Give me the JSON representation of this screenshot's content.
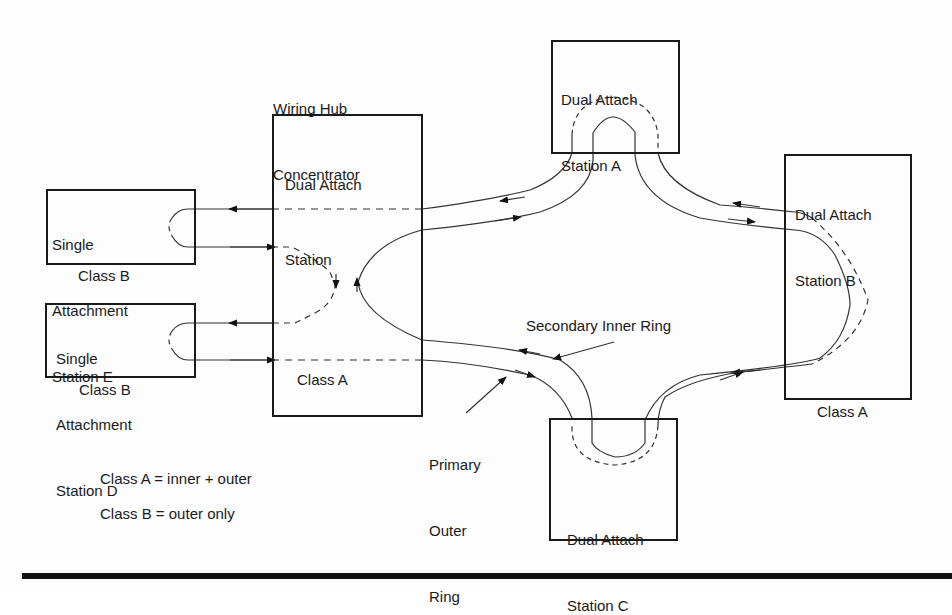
{
  "diagram": {
    "title_label": {
      "line1": "Wiring Hub",
      "line2": "Concentrator"
    },
    "nodes": {
      "concentrator": {
        "line1": "Dual Attach",
        "line2": "Station",
        "class_label": "Class A"
      },
      "station_e": {
        "line1": "Single",
        "line2": "Attachment",
        "line3": "Station E",
        "class_label": "Class B"
      },
      "station_d": {
        "line1": "Single",
        "line2": "Attachment",
        "line3": "Station D",
        "class_label": "Class B"
      },
      "station_a": {
        "line1": "Dual Attach",
        "line2": "Station A"
      },
      "station_b": {
        "line1": "Dual Attach",
        "line2": "Station B",
        "class_label": "Class A"
      },
      "station_c": {
        "line1": "Dual Attach",
        "line2": "Station C"
      }
    },
    "ring_labels": {
      "secondary": "Secondary Inner Ring",
      "primary": {
        "line1": "Primary",
        "line2": "Outer",
        "line3": "Ring"
      }
    },
    "legend": {
      "class_a": "Class A = inner + outer",
      "class_b": "Class B = outer only"
    },
    "colors": {
      "ink": "#1a1a1a",
      "line": "#333333",
      "background": "#fdfdfd"
    }
  }
}
